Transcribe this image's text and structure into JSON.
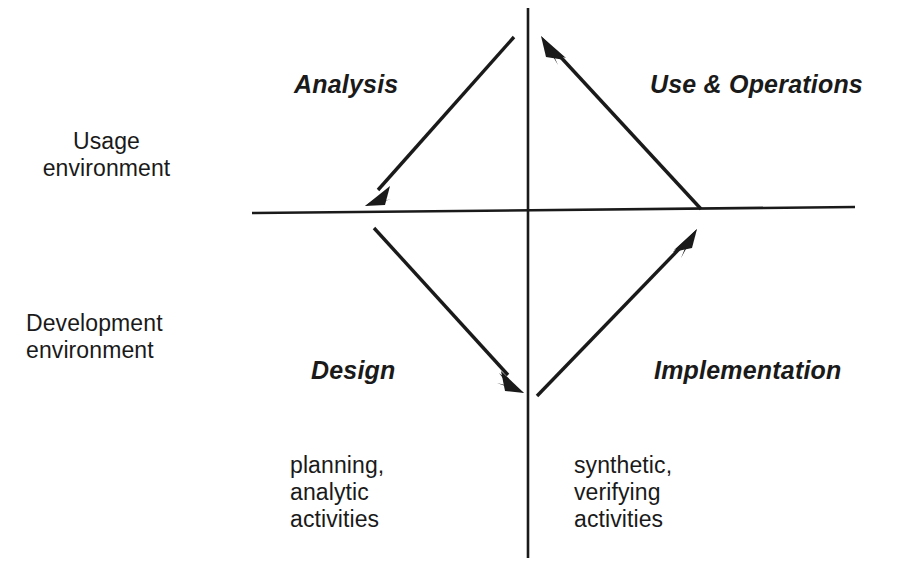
{
  "diagram": {
    "axes": {
      "vertical_axis_name": "vertical-divider",
      "horizontal_axis_name": "horizontal-divider",
      "line_color": "#1a1a1a"
    },
    "environments": [
      {
        "id": "usage",
        "label": "Usage\nenvironment"
      },
      {
        "id": "development",
        "label": "Development\nenvironment"
      }
    ],
    "phases": [
      {
        "id": "analysis",
        "label": "Analysis",
        "quadrant": "upper-left"
      },
      {
        "id": "use-operations",
        "label": "Use & Operations",
        "quadrant": "upper-right"
      },
      {
        "id": "design",
        "label": "Design",
        "quadrant": "lower-left"
      },
      {
        "id": "implementation",
        "label": "Implementation",
        "quadrant": "lower-right"
      }
    ],
    "activities": [
      {
        "id": "left",
        "label": "planning,\nanalytic\nactivities",
        "side": "left"
      },
      {
        "id": "right",
        "label": "synthetic,\nverifying\nactivities",
        "side": "right"
      }
    ],
    "arrows": [
      {
        "id": "analysis-arrow",
        "from": "top-center",
        "to": "left-on-horizontal-axis",
        "direction": "down-left"
      },
      {
        "id": "design-arrow",
        "from": "left-on-horizontal-axis",
        "to": "bottom-center",
        "direction": "down-right"
      },
      {
        "id": "implementation-arrow",
        "from": "bottom-center",
        "to": "right-on-horizontal-axis",
        "direction": "up-right"
      },
      {
        "id": "use-operations-arrow",
        "from": "right-on-horizontal-axis",
        "to": "top-center",
        "direction": "up-left"
      }
    ]
  }
}
